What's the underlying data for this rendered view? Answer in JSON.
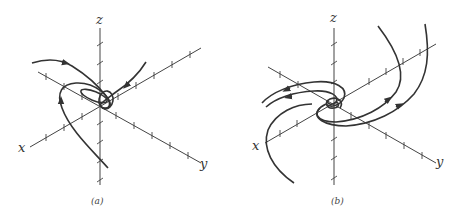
{
  "panels": [
    {
      "id": "a",
      "caption": "(a)",
      "axis_labels": {
        "x": "x",
        "y": "y",
        "z": "z"
      },
      "description": "Trajectories spiraling into origin (stable spiral/focus) in 3D phase space"
    },
    {
      "id": "b",
      "caption": "(b)",
      "axis_labels": {
        "x": "x",
        "y": "y",
        "z": "z"
      },
      "description": "Trajectories spiraling out from origin in a plane (unstable spiral) in 3D phase space"
    }
  ],
  "colors": {
    "line": "#333333",
    "axis": "#444444",
    "background": "#ffffff"
  }
}
